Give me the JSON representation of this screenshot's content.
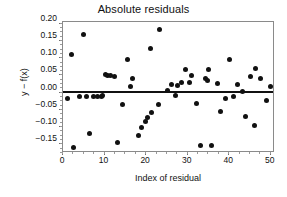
{
  "chart_data": {
    "type": "scatter",
    "title": "Absolute residuals",
    "xlabel": "Index of residual",
    "ylabel": "y − f(x)",
    "xlim": [
      0,
      51
    ],
    "ylim": [
      -0.175,
      0.205
    ],
    "grid": false,
    "legend": null,
    "xticks": [
      0,
      10,
      20,
      30,
      40,
      50
    ],
    "xtick_labels": [
      "0",
      "10",
      "20",
      "30",
      "40",
      "50"
    ],
    "yticks": [
      0.2,
      0.15,
      0.1,
      0.05,
      0.0,
      -0.05,
      -0.1,
      -0.15
    ],
    "ytick_labels": [
      "0.20",
      "0.15",
      "0.10",
      "0.05",
      "0.00",
      "-0.05",
      "-0.10",
      "-0.15"
    ],
    "marker": "filled-circle",
    "marker_color": "#111111",
    "reference_line": {
      "orientation": "horizontal",
      "y": 0.002,
      "color": "#111111",
      "width": 2
    },
    "x": [
      1,
      2,
      3,
      4,
      5,
      6,
      7,
      8,
      9,
      10,
      10.6,
      11.2,
      12,
      13,
      14,
      15,
      16,
      17,
      18,
      19,
      20,
      21,
      22,
      23,
      24,
      25,
      26,
      27,
      28,
      29,
      30,
      31,
      32,
      33,
      34,
      35,
      36,
      37,
      38,
      39,
      40,
      41,
      42,
      43,
      44,
      45,
      46,
      47,
      48,
      49,
      50
    ],
    "y": [
      -0.016,
      0.111,
      -0.158,
      -0.011,
      0.17,
      -0.012,
      -0.118,
      -0.011,
      -0.012,
      0.052,
      0.051,
      0.05,
      0.048,
      -0.145,
      -0.032,
      0.095,
      0.017,
      0.04,
      -0.125,
      -0.1,
      -0.085,
      -0.072,
      -0.057,
      0.128,
      -0.033,
      0.182,
      0.007,
      0.025,
      -0.009,
      0.02,
      0.03,
      0.067,
      0.05,
      -0.031,
      -0.153,
      0.042,
      0.036,
      0.066,
      -0.152,
      0.027,
      -0.055,
      -0.018,
      0.097,
      -0.012,
      0.023,
      0.004,
      -0.07,
      0.047,
      0.069,
      -0.094,
      0.04,
      -0.023,
      0.017
    ],
    "points": [
      {
        "x": 1,
        "y": -0.016
      },
      {
        "x": 2,
        "y": 0.111
      },
      {
        "x": 2.6,
        "y": -0.158
      },
      {
        "x": 4,
        "y": -0.011
      },
      {
        "x": 5,
        "y": 0.17
      },
      {
        "x": 5.6,
        "y": -0.012
      },
      {
        "x": 6.4,
        "y": -0.118
      },
      {
        "x": 7.4,
        "y": -0.011
      },
      {
        "x": 8.4,
        "y": -0.012
      },
      {
        "x": 9.2,
        "y": -0.01
      },
      {
        "x": 9.6,
        "y": -0.008
      },
      {
        "x": 10.2,
        "y": 0.053
      },
      {
        "x": 10.8,
        "y": 0.051
      },
      {
        "x": 11.4,
        "y": 0.05
      },
      {
        "x": 12.4,
        "y": 0.048
      },
      {
        "x": 13.2,
        "y": -0.145
      },
      {
        "x": 14.2,
        "y": -0.033
      },
      {
        "x": 15.6,
        "y": 0.095
      },
      {
        "x": 16.2,
        "y": 0.017
      },
      {
        "x": 16.8,
        "y": 0.04
      },
      {
        "x": 18.2,
        "y": -0.125
      },
      {
        "x": 19.0,
        "y": -0.1
      },
      {
        "x": 19.8,
        "y": -0.085
      },
      {
        "x": 20.4,
        "y": -0.072
      },
      {
        "x": 21.0,
        "y": 0.128
      },
      {
        "x": 21.4,
        "y": -0.057
      },
      {
        "x": 23.2,
        "y": 0.182
      },
      {
        "x": 23.0,
        "y": -0.033
      },
      {
        "x": 25.2,
        "y": 0.007
      },
      {
        "x": 26.0,
        "y": 0.025
      },
      {
        "x": 27.0,
        "y": -0.009
      },
      {
        "x": 27.6,
        "y": 0.021
      },
      {
        "x": 28.6,
        "y": 0.03
      },
      {
        "x": 29.4,
        "y": 0.067
      },
      {
        "x": 30.4,
        "y": 0.03
      },
      {
        "x": 31.0,
        "y": 0.05
      },
      {
        "x": 32.2,
        "y": -0.031
      },
      {
        "x": 33.0,
        "y": -0.153
      },
      {
        "x": 34.2,
        "y": 0.042
      },
      {
        "x": 34.8,
        "y": 0.036
      },
      {
        "x": 35.0,
        "y": 0.066
      },
      {
        "x": 35.8,
        "y": -0.152
      },
      {
        "x": 37.2,
        "y": 0.027
      },
      {
        "x": 38.0,
        "y": -0.055
      },
      {
        "x": 39.0,
        "y": -0.018
      },
      {
        "x": 40.0,
        "y": 0.097
      },
      {
        "x": 41.0,
        "y": -0.012
      },
      {
        "x": 42.0,
        "y": 0.023
      },
      {
        "x": 43.2,
        "y": 0.004
      },
      {
        "x": 44.0,
        "y": -0.07
      },
      {
        "x": 45.2,
        "y": 0.047
      },
      {
        "x": 46.2,
        "y": 0.069
      },
      {
        "x": 46.0,
        "y": -0.094
      },
      {
        "x": 47.6,
        "y": 0.04
      },
      {
        "x": 49.0,
        "y": -0.023
      },
      {
        "x": 50.0,
        "y": 0.017
      }
    ]
  }
}
